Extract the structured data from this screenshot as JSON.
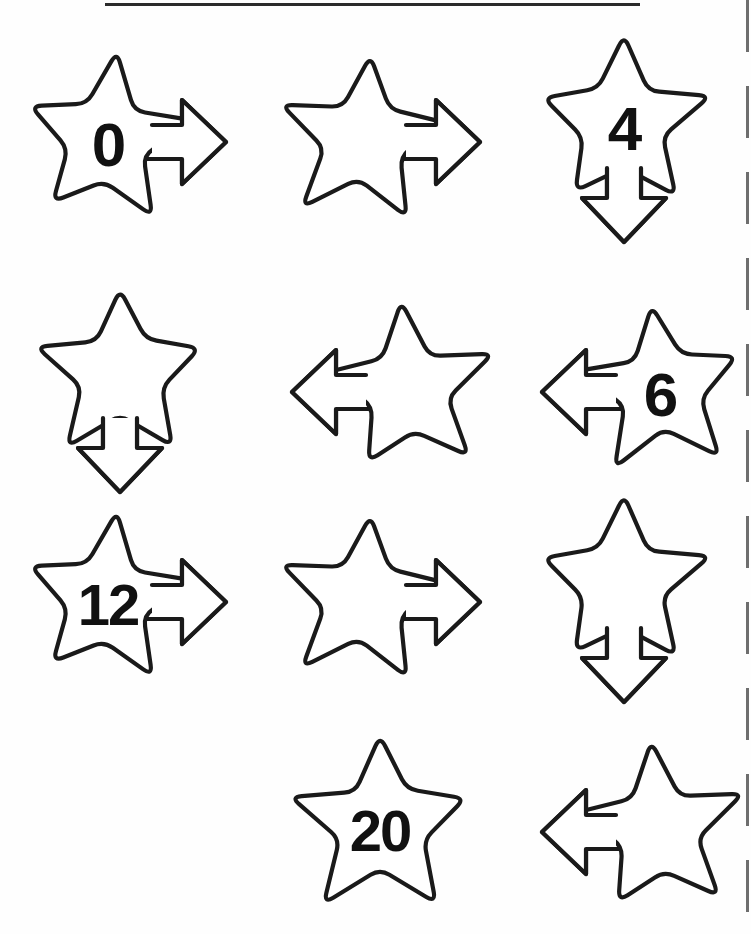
{
  "worksheet": {
    "title": "Skip counting stars worksheet",
    "top_rule": "horizontal-rule",
    "right_margin": "dashed-line",
    "ink_color": "#1a1a1a",
    "paper_color": "#ffffff",
    "columns": 3,
    "rows": 4
  },
  "shapes": [
    {
      "id": "s1",
      "row": 1,
      "col": 1,
      "kind": "star-arrow",
      "direction": "right",
      "label": "0",
      "filled": true
    },
    {
      "id": "s2",
      "row": 1,
      "col": 2,
      "kind": "star-arrow",
      "direction": "right",
      "label": "",
      "filled": false
    },
    {
      "id": "s3",
      "row": 1,
      "col": 3,
      "kind": "star-arrow",
      "direction": "down",
      "label": "4",
      "filled": true
    },
    {
      "id": "s4",
      "row": 2,
      "col": 1,
      "kind": "star-arrow",
      "direction": "down",
      "label": "",
      "filled": false
    },
    {
      "id": "s5",
      "row": 2,
      "col": 2,
      "kind": "star-arrow",
      "direction": "left",
      "label": "",
      "filled": false
    },
    {
      "id": "s6",
      "row": 2,
      "col": 3,
      "kind": "star-arrow",
      "direction": "left",
      "label": "6",
      "filled": true
    },
    {
      "id": "s7",
      "row": 3,
      "col": 1,
      "kind": "star-arrow",
      "direction": "right",
      "label": "12",
      "filled": true
    },
    {
      "id": "s8",
      "row": 3,
      "col": 2,
      "kind": "star-arrow",
      "direction": "right",
      "label": "",
      "filled": false
    },
    {
      "id": "s9",
      "row": 3,
      "col": 3,
      "kind": "star-arrow",
      "direction": "down",
      "label": "",
      "filled": false
    },
    {
      "id": "s10",
      "row": 4,
      "col": 2,
      "kind": "star-plain",
      "direction": "none",
      "label": "20",
      "filled": true
    },
    {
      "id": "s11",
      "row": 4,
      "col": 3,
      "kind": "star-arrow",
      "direction": "left",
      "label": "",
      "filled": false
    }
  ],
  "sequence": {
    "known_values": [
      "0",
      "4",
      "6",
      "12",
      "20"
    ],
    "blank_count": 6
  }
}
